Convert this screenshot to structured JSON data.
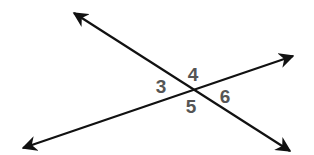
{
  "diagram": {
    "type": "intersecting-lines",
    "line_color": "#111111",
    "label_color": "#555555",
    "lines": [
      {
        "name": "line-a",
        "from": [
          74,
          13
        ],
        "to": [
          290,
          151
        ],
        "arrows": "both"
      },
      {
        "name": "line-b",
        "from": [
          23,
          148
        ],
        "to": [
          293,
          56
        ],
        "arrows": "both"
      }
    ],
    "intersection": [
      191,
      90
    ],
    "angles": [
      {
        "label": "3",
        "x": 161,
        "y": 93
      },
      {
        "label": "4",
        "x": 193,
        "y": 81
      },
      {
        "label": "5",
        "x": 191,
        "y": 113
      },
      {
        "label": "6",
        "x": 225,
        "y": 103
      }
    ]
  }
}
